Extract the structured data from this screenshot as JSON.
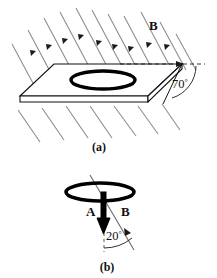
{
  "figure": {
    "panels": [
      {
        "id": "a",
        "caption": "(a)",
        "field_label": "B",
        "angle_label": "70",
        "angle_unit": "°",
        "angle_value": 70,
        "description": "Uniform magnetic field lines crossing a flat tilted plate with a circular coil on it; the plate edge makes 70 degrees with the horizontal dashed reference line.",
        "elements": {
          "coil": "circular-coil",
          "plate": "tilted-plate",
          "reference": "horizontal-dashed-line",
          "field_lines_count": 17
        }
      },
      {
        "id": "b",
        "caption": "(b)",
        "axis_label": "A",
        "field_label": "B",
        "angle_label": "20",
        "angle_unit": "°",
        "angle_value": 20,
        "description": "Edge-on view of the coil: normal vector A points straight down, field B is tilted 20 degrees from A.",
        "elements": {
          "coil": "circular-coil-edge-on",
          "normal_vector": "A",
          "field_vector": "B",
          "reference": "vertical-dashed-line"
        }
      }
    ],
    "colors": {
      "ink": "#111111",
      "field_line": "#8c8c8c",
      "background": "#ffffff",
      "coil": "#000000"
    }
  }
}
